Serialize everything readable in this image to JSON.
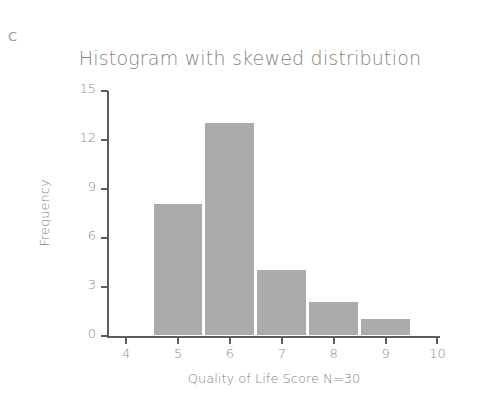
{
  "panel": {
    "label": "C"
  },
  "chart_data": {
    "type": "bar",
    "title": "Histogram with skewed distribution",
    "xlabel": "Quality of Life Score N=30",
    "ylabel": "Frequency",
    "categories": [
      5,
      6,
      7,
      8,
      9
    ],
    "values": [
      8,
      13,
      4,
      2,
      1
    ],
    "x_tick_labels": [
      "4",
      "5",
      "6",
      "7",
      "8",
      "9",
      "10"
    ],
    "x_tick_values": [
      4,
      5,
      6,
      7,
      8,
      9,
      10
    ],
    "y_tick_labels": [
      "0",
      "3",
      "6",
      "9",
      "12",
      "15"
    ],
    "y_tick_values": [
      0,
      3,
      6,
      9,
      12,
      15
    ],
    "xlim": [
      3.65,
      10.05
    ],
    "ylim": [
      0,
      15
    ],
    "bin_width": 1,
    "grid": false,
    "legend": false,
    "bar_color": "#ababab",
    "axis_color": "#5d5d5d",
    "text_color": "#848484"
  }
}
